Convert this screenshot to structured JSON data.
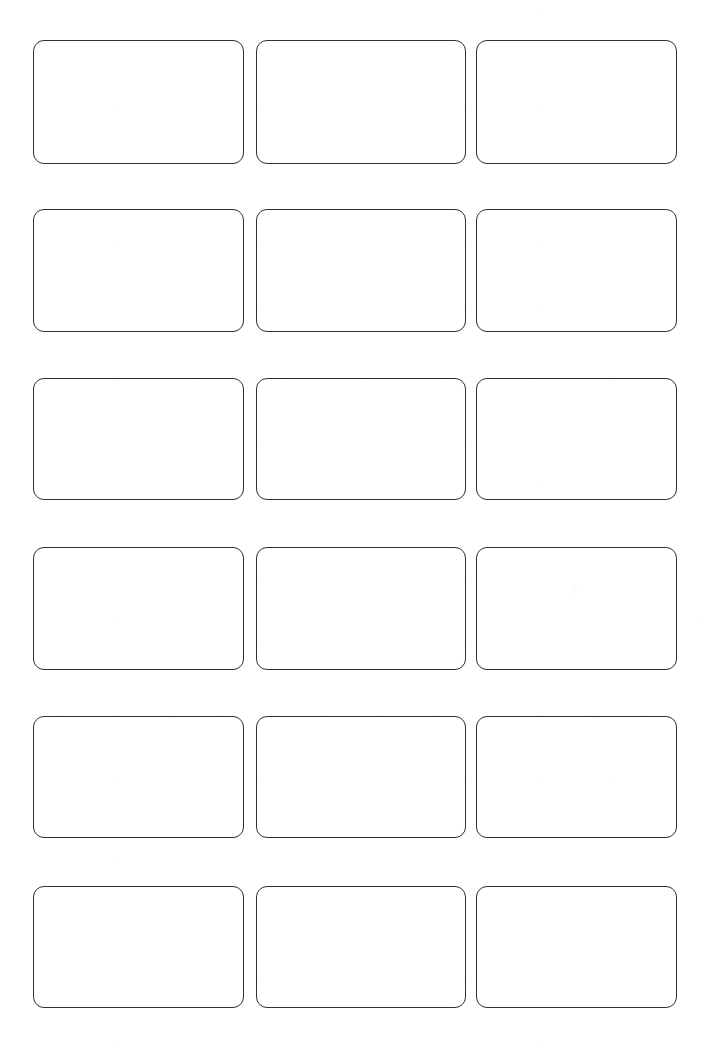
{
  "page": {
    "background_color": "#ffffff",
    "width": 725,
    "height": 1053,
    "content_text": ""
  },
  "grid": {
    "columns": 3,
    "rows": 6,
    "total_cards": 18,
    "column_gap_px": 12,
    "row_gap_px": 48,
    "card_corner_radius_px": 11,
    "card_border_width_px": 1.6,
    "card_border_color": "#2e2e32",
    "card_fill_color": "#ffffff"
  },
  "columns": [
    {
      "index": 1,
      "left": 33,
      "width": 211
    },
    {
      "index": 2,
      "left": 256,
      "width": 210
    },
    {
      "index": 3,
      "left": 476,
      "width": 201
    }
  ],
  "rows": [
    {
      "index": 1,
      "top": 40,
      "height": 124
    },
    {
      "index": 2,
      "top": 209,
      "height": 123
    },
    {
      "index": 3,
      "top": 378,
      "height": 122
    },
    {
      "index": 4,
      "top": 547,
      "height": 123
    },
    {
      "index": 5,
      "top": 716,
      "height": 122
    },
    {
      "index": 6,
      "top": 886,
      "height": 122
    }
  ],
  "cards": [
    {
      "id": "card-r1c1",
      "row": 1,
      "col": 1,
      "label": ""
    },
    {
      "id": "card-r1c2",
      "row": 1,
      "col": 2,
      "label": ""
    },
    {
      "id": "card-r1c3",
      "row": 1,
      "col": 3,
      "label": ""
    },
    {
      "id": "card-r2c1",
      "row": 2,
      "col": 1,
      "label": ""
    },
    {
      "id": "card-r2c2",
      "row": 2,
      "col": 2,
      "label": ""
    },
    {
      "id": "card-r2c3",
      "row": 2,
      "col": 3,
      "label": ""
    },
    {
      "id": "card-r3c1",
      "row": 3,
      "col": 1,
      "label": ""
    },
    {
      "id": "card-r3c2",
      "row": 3,
      "col": 2,
      "label": ""
    },
    {
      "id": "card-r3c3",
      "row": 3,
      "col": 3,
      "label": ""
    },
    {
      "id": "card-r4c1",
      "row": 4,
      "col": 1,
      "label": ""
    },
    {
      "id": "card-r4c2",
      "row": 4,
      "col": 2,
      "label": ""
    },
    {
      "id": "card-r4c3",
      "row": 4,
      "col": 3,
      "label": ""
    },
    {
      "id": "card-r5c1",
      "row": 5,
      "col": 1,
      "label": ""
    },
    {
      "id": "card-r5c2",
      "row": 5,
      "col": 2,
      "label": ""
    },
    {
      "id": "card-r5c3",
      "row": 5,
      "col": 3,
      "label": ""
    },
    {
      "id": "card-r6c1",
      "row": 6,
      "col": 1,
      "label": ""
    },
    {
      "id": "card-r6c2",
      "row": 6,
      "col": 2,
      "label": ""
    },
    {
      "id": "card-r6c3",
      "row": 6,
      "col": 3,
      "label": ""
    }
  ],
  "artifacts": [
    {
      "id": "speck-1",
      "x": 571,
      "y": 589
    },
    {
      "id": "speck-2",
      "x": 574,
      "y": 583
    }
  ]
}
